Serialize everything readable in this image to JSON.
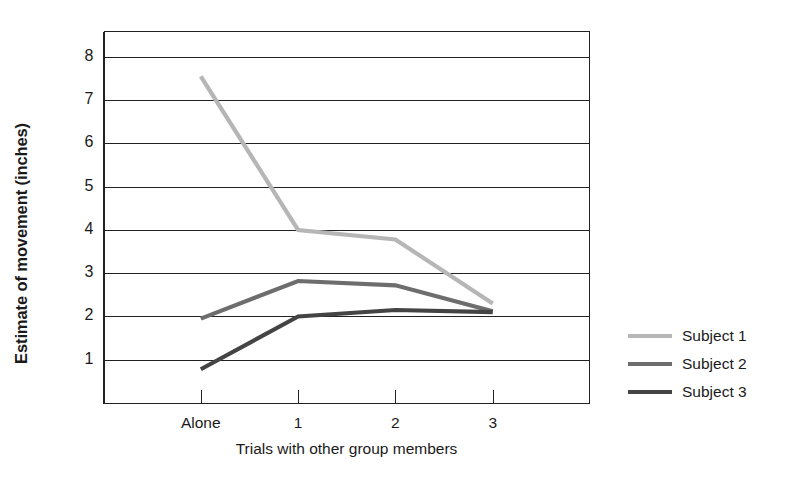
{
  "chart_data": {
    "type": "line",
    "title": "",
    "xlabel": "Trials with other group members",
    "ylabel": "Estimate of movement (inches)",
    "categories": [
      "Alone",
      "1",
      "2",
      "3"
    ],
    "xtick_labels": [
      "Alone",
      "1",
      "2",
      "3"
    ],
    "ytick_labels": [
      "1",
      "2",
      "3",
      "4",
      "5",
      "6",
      "7",
      "8"
    ],
    "yticks": [
      1,
      2,
      3,
      4,
      5,
      6,
      7,
      8
    ],
    "ylim": [
      0,
      8.6
    ],
    "xlim": [
      0,
      5
    ],
    "grid": "horizontal",
    "legend_position": "right",
    "series": [
      {
        "name": "Subject 1",
        "color": "#b6b6b6",
        "values": [
          7.55,
          4.0,
          3.78,
          2.3
        ]
      },
      {
        "name": "Subject 2",
        "color": "#6d6d6d",
        "values": [
          1.95,
          2.82,
          2.72,
          2.12
        ]
      },
      {
        "name": "Subject 3",
        "color": "#444444",
        "values": [
          0.78,
          2.0,
          2.15,
          2.1
        ]
      }
    ]
  },
  "legend": {
    "items": [
      {
        "label": "Subject 1",
        "color": "#b6b6b6"
      },
      {
        "label": "Subject 2",
        "color": "#6d6d6d"
      },
      {
        "label": "Subject 3",
        "color": "#444444"
      }
    ]
  },
  "axes": {
    "axis_color": "#222222",
    "grid_color": "#222222"
  }
}
